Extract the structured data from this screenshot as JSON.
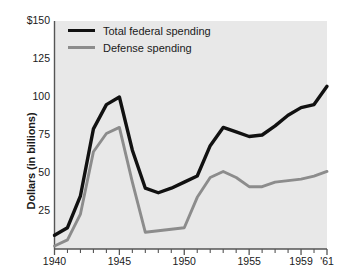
{
  "chart_data": {
    "type": "line",
    "title": "",
    "xlabel": "",
    "ylabel": "Dollars (in billions)",
    "xlim": [
      1940,
      1961
    ],
    "ylim": [
      0,
      150
    ],
    "grid": false,
    "legend_position": "top-left",
    "background_color": "#e8e8e8",
    "x_tick_labels": [
      "1940",
      "1945",
      "1950",
      "1955",
      "1959",
      "'61"
    ],
    "x_tick_values": [
      1940,
      1945,
      1950,
      1955,
      1959,
      1961
    ],
    "x_minor_ticks": [
      1941,
      1942,
      1943,
      1944,
      1946,
      1947,
      1948,
      1949,
      1951,
      1952,
      1953,
      1954,
      1956,
      1957,
      1958,
      1960
    ],
    "y_tick_labels": [
      "$150",
      "125",
      "100",
      "75",
      "50",
      "25"
    ],
    "y_tick_values": [
      150,
      125,
      100,
      75,
      50,
      25
    ],
    "x": [
      1940,
      1941,
      1942,
      1943,
      1944,
      1945,
      1946,
      1947,
      1948,
      1949,
      1950,
      1951,
      1952,
      1953,
      1954,
      1955,
      1956,
      1957,
      1958,
      1959,
      1960,
      1961
    ],
    "series": [
      {
        "name": "Total federal spending",
        "color": "#111111",
        "values": [
          9,
          14,
          35,
          79,
          95,
          100,
          65,
          40,
          37,
          40,
          44,
          48,
          68,
          80,
          77,
          74,
          75,
          81,
          88,
          93,
          95,
          107
        ]
      },
      {
        "name": "Defense spending",
        "color": "#8c8c8c",
        "values": [
          2,
          6,
          23,
          64,
          76,
          80,
          44,
          11,
          12,
          13,
          14,
          34,
          47,
          51,
          47,
          41,
          41,
          44,
          45,
          46,
          48,
          51
        ]
      }
    ]
  },
  "axes": {
    "y_title": "Dollars (in billions)"
  },
  "legend": {
    "items": [
      {
        "label": "Total federal spending",
        "style": "total"
      },
      {
        "label": "Defense spending",
        "style": "defense"
      }
    ]
  }
}
